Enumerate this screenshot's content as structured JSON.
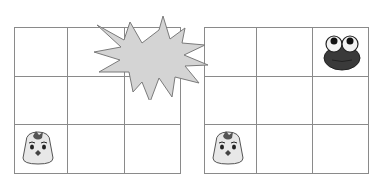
{
  "scene": {
    "description": "Two 3x3 grids. Left grid: chick at bottom-left cell, starburst explosion covering top-right corner. Right grid: chick at bottom-left cell, frog at top-right cell.",
    "colors": {
      "grid_line": "#8a8a8a",
      "starburst_fill": "#d4d4d4",
      "starburst_stroke": "#7a7a7a",
      "chick_body": "#e8e8e8",
      "chick_crest": "#555555",
      "frog_body": "#3a3a3a"
    }
  },
  "grids": [
    {
      "id": "left",
      "rows": 3,
      "cols": 3,
      "cells": [
        [
          "",
          "",
          "starburst"
        ],
        [
          "",
          "",
          ""
        ],
        [
          "chick",
          "",
          ""
        ]
      ]
    },
    {
      "id": "right",
      "rows": 3,
      "cols": 3,
      "cells": [
        [
          "",
          "",
          "frog"
        ],
        [
          "",
          "",
          ""
        ],
        [
          "chick",
          "",
          ""
        ]
      ]
    }
  ]
}
